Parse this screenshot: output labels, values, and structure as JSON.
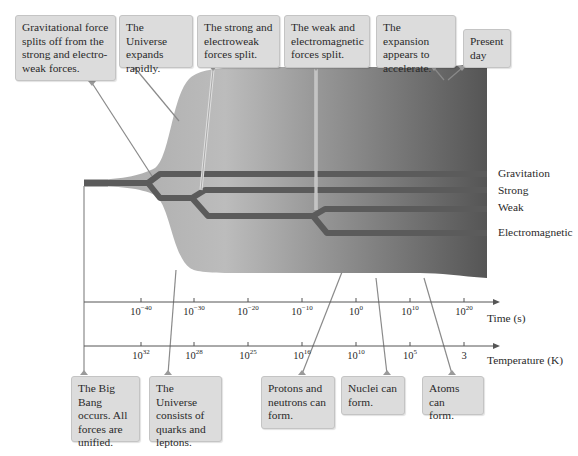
{
  "diagram": {
    "top_callouts": [
      {
        "id": "grav-split",
        "lines": [
          "Gravitational force",
          "splits off from the",
          "strong and electro-",
          "weak forces."
        ]
      },
      {
        "id": "expands",
        "lines": [
          "The Universe",
          "expands",
          "rapidly."
        ]
      },
      {
        "id": "strong-ew-split",
        "lines": [
          "The strong and",
          "electroweak",
          "forces split."
        ]
      },
      {
        "id": "weak-em-split",
        "lines": [
          "The weak and",
          "electromagnetic",
          "forces split."
        ]
      },
      {
        "id": "accelerate",
        "lines": [
          "The expansion",
          "appears to",
          "accelerate."
        ]
      },
      {
        "id": "present",
        "lines": [
          "Present",
          "day"
        ]
      }
    ],
    "bottom_callouts": [
      {
        "id": "big-bang",
        "lines": [
          "The Big Bang",
          "occurs. All",
          "forces  are",
          "unified."
        ]
      },
      {
        "id": "quarks",
        "lines": [
          "The Universe",
          "consists of",
          "quarks and",
          "leptons."
        ]
      },
      {
        "id": "protons",
        "lines": [
          "Protons and",
          "neutrons can",
          "form."
        ]
      },
      {
        "id": "nuclei",
        "lines": [
          "Nuclei can",
          "form."
        ]
      },
      {
        "id": "atoms",
        "lines": [
          "Atoms can",
          "form."
        ]
      }
    ],
    "forces": [
      "Gravitation",
      "Strong",
      "Weak",
      "Electromagnetic"
    ],
    "time_axis": {
      "label": "Time (s)",
      "ticks": [
        {
          "base": "10",
          "exp": "−40"
        },
        {
          "base": "10",
          "exp": "−30"
        },
        {
          "base": "10",
          "exp": "−20"
        },
        {
          "base": "10",
          "exp": "−10"
        },
        {
          "base": "10",
          "exp": "0"
        },
        {
          "base": "10",
          "exp": "10"
        },
        {
          "base": "10",
          "exp": "20"
        }
      ]
    },
    "temperature_axis": {
      "label": "Temperature (K)",
      "ticks": [
        {
          "base": "10",
          "exp": "32"
        },
        {
          "base": "10",
          "exp": "28"
        },
        {
          "base": "10",
          "exp": "25"
        },
        {
          "base": "10",
          "exp": "16"
        },
        {
          "base": "10",
          "exp": "10"
        },
        {
          "base": "10",
          "exp": "5"
        },
        {
          "base": "3",
          "exp": ""
        }
      ]
    },
    "colors": {
      "callout_bg": "#dcdcdc",
      "force_band": "#5b5b5b",
      "universe_light": "#b8b8b8",
      "universe_dark": "#5a5a5a",
      "leader_line": "#8a8a8a",
      "axis": "#555555"
    }
  }
}
